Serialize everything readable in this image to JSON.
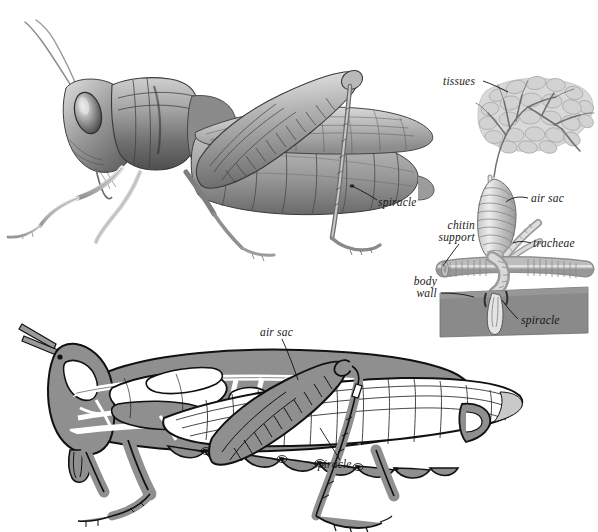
{
  "figure": {
    "title": "",
    "background_color": "#ffffff",
    "palette": {
      "ink": "#1a1a1a",
      "outline": "#111111",
      "body_fill": "#8f8f8f",
      "body_fill_dark": "#7a7a7a",
      "body_fill_light": "#a8a8a8",
      "tube_white": "#ffffff",
      "tissue_fill": "#d4d4d4",
      "tissue_outline": "#b0b0b0",
      "body_wall_fill": "#8a8a8a",
      "graphite_dark": "#4a4a4a",
      "graphite_mid": "#8d8d8d",
      "graphite_light": "#c9c9c9"
    }
  },
  "panels": {
    "top_left": {
      "name": "grasshopper-photorealistic-drawing",
      "description": "Shaded graphite drawing of a grasshopper in lateral view",
      "labels": [
        {
          "text": "spiracle",
          "x": 378,
          "y": 204,
          "align": "left"
        }
      ]
    },
    "right": {
      "name": "tracheal-detail-diagram",
      "description": "Enlarged detail of air sac, tracheae, spiracle and body wall with tissues",
      "labels": [
        {
          "text": "tissues",
          "x": 443,
          "y": 84,
          "align": "left"
        },
        {
          "text": "air sac",
          "x": 531,
          "y": 201,
          "align": "left"
        },
        {
          "text": "chitin",
          "x": 475,
          "y": 228,
          "align": "right"
        },
        {
          "text": "support",
          "x": 475,
          "y": 240,
          "align": "right"
        },
        {
          "text": "tracheae",
          "x": 533,
          "y": 246,
          "align": "left"
        },
        {
          "text": "body",
          "x": 437,
          "y": 284,
          "align": "right"
        },
        {
          "text": "wall",
          "x": 437,
          "y": 296,
          "align": "right"
        },
        {
          "text": "spiracle",
          "x": 521,
          "y": 323,
          "align": "left"
        }
      ]
    },
    "bottom": {
      "name": "grasshopper-tracheal-system-schematic",
      "description": "Schematic lateral cutaway of grasshopper showing tracheal tubes, air sacs and spiracles",
      "labels": [
        {
          "text": "air sac",
          "x": 260,
          "y": 334,
          "align": "left"
        },
        {
          "text": "spiracle",
          "x": 313,
          "y": 466,
          "align": "left"
        }
      ]
    }
  },
  "terms": {
    "spiracle": "spiracle",
    "tissues": "tissues",
    "air_sac": "air sac",
    "chitin": "chitin",
    "support": "support",
    "tracheae": "tracheae",
    "body": "body",
    "wall": "wall"
  }
}
